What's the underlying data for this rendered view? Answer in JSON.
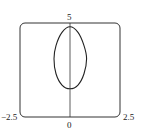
{
  "chart_data": {
    "type": "line",
    "title": "",
    "xlabel": "",
    "ylabel": "",
    "xlim": [
      -2.5,
      2.5
    ],
    "ylim": [
      0,
      5
    ],
    "grid": false,
    "legend": null,
    "tick_labels": {
      "x_min": "−2.5",
      "x_max": "2.5",
      "y_min": "0",
      "y_max": "5"
    },
    "series": [
      {
        "name": "closed curve",
        "x": [
          0.0,
          0.4,
          0.7,
          0.83,
          0.7,
          0.4,
          0.0,
          -0.4,
          -0.7,
          -0.8,
          -0.7,
          -0.4,
          0.0
        ],
        "y": [
          4.8,
          4.5,
          3.8,
          3.1,
          2.3,
          1.7,
          1.5,
          1.7,
          2.3,
          3.1,
          3.8,
          4.5,
          4.8
        ]
      }
    ],
    "axes": {
      "vertical_axis_at_x": 0
    }
  },
  "labels": {
    "x_min": "−2.5",
    "x_max": "2.5",
    "y_min": "0",
    "y_max": "5"
  }
}
